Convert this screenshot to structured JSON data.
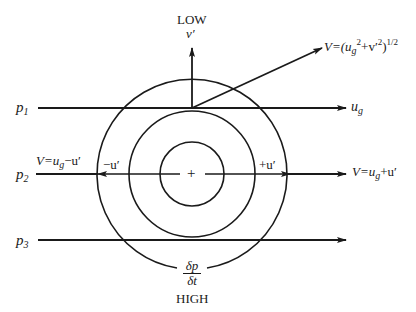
{
  "labels": {
    "low": "LOW",
    "high": "HIGH",
    "v_prime": "v′",
    "p1": "p",
    "p1_sub": "1",
    "p2": "p",
    "p2_sub": "2",
    "p3": "p",
    "p3_sub": "3",
    "ug": "u",
    "ug_sub": "g",
    "v_total_prefix": "V=(u",
    "v_total_sub": "g",
    "v_total_sup1": "2",
    "v_total_mid": "+v′",
    "v_total_sup2": "2",
    "v_total_close": ")",
    "v_total_sup3": "1/2",
    "v_minus_prefix": "V=u",
    "v_minus_sub": "g",
    "v_minus_suffix": "−u′",
    "v_plus_prefix": "V=u",
    "v_plus_sub": "g",
    "v_plus_suffix": "+u′",
    "minus_u": "−u′",
    "plus_u": "+u′",
    "center_mark": "+",
    "dp_num": "δp",
    "dp_den": "δt"
  },
  "geometry": {
    "center": [
      192,
      174
    ],
    "radii": [
      32,
      63,
      95
    ],
    "isobars_y": [
      108,
      174,
      240
    ],
    "stroke": "#1a1a1a"
  }
}
